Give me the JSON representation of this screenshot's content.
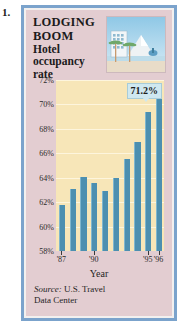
{
  "figure_number": "1.",
  "panel": {
    "headline_line1": "LODGING",
    "headline_line2": "BOOM",
    "subhead_line1": "Hotel",
    "subhead_line2": "occupancy",
    "subhead_line3": "rate",
    "illustration_name": "beach-resort-hotel-illustration"
  },
  "callout": {
    "value_label": "71.2%"
  },
  "source": {
    "lead": "Source:",
    "text": " U.S. Travel",
    "line2": "Data Center"
  },
  "colors": {
    "frame_blue": "#7ba3cc",
    "panel_background": "#e3cdd1",
    "plot_background": "#f7e6b8",
    "bar_color": "#4c8fb0",
    "bar_highlight": "#7fb6ce",
    "callout_background": "#cfe8f0",
    "gridline": "#fdf5dd"
  },
  "chart_data": {
    "type": "bar",
    "xlabel": "Year",
    "ylabel": "",
    "ylim": [
      58,
      72
    ],
    "ytick_labels": [
      "72%",
      "70%",
      "68%",
      "66%",
      "64%",
      "62%",
      "60%",
      "58%"
    ],
    "ytick_values": [
      72,
      70,
      68,
      66,
      64,
      62,
      60,
      58
    ],
    "grid": true,
    "legend": "none",
    "categories": [
      "'87",
      "'88",
      "'89",
      "'90",
      "'91",
      "'92",
      "'93",
      "'94",
      "'95",
      "'96"
    ],
    "xtick_labels": [
      "'87",
      "'90",
      "'95",
      "'96"
    ],
    "xtick_categories": [
      "'87",
      "'90",
      "'95",
      "'96"
    ],
    "values": [
      61.8,
      63.1,
      64.1,
      63.6,
      62.9,
      64.0,
      65.5,
      66.9,
      69.4,
      71.2
    ],
    "annotations": [
      {
        "category": "'96",
        "label": "71.2%",
        "value": 71.2
      }
    ]
  }
}
